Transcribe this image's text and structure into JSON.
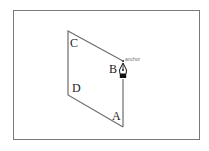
{
  "diagram": {
    "frame": {
      "x": 13,
      "y": 10,
      "width": 187,
      "height": 130,
      "border_color": "#7a7a7a"
    },
    "shape": {
      "type": "open-parallelogram-path",
      "stroke_color": "#6e6e6e",
      "points": [
        {
          "x": 123,
          "y": 127
        },
        {
          "x": 68,
          "y": 95
        },
        {
          "x": 68,
          "y": 31
        },
        {
          "x": 123,
          "y": 61
        }
      ],
      "segment_in_progress": {
        "from": {
          "x": 123,
          "y": 127
        },
        "to": {
          "x": 123,
          "y": 80
        }
      }
    },
    "labels": {
      "A": "A",
      "B": "B",
      "C": "C",
      "D": "D"
    },
    "cursor": {
      "icon": "pen-tool-icon",
      "tooltip": "anchor"
    }
  }
}
